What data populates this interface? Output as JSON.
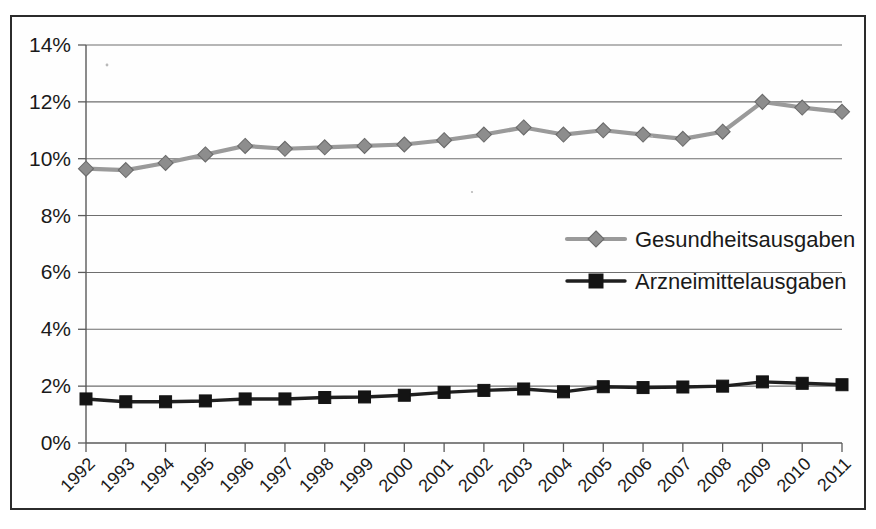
{
  "chart_data": {
    "type": "line",
    "title": "",
    "subtitle": "",
    "xlabel": "",
    "ylabel": "",
    "grid": true,
    "legend_position": "inside-center-right",
    "categories": [
      "1992",
      "1993",
      "1994",
      "1995",
      "1996",
      "1997",
      "1998",
      "1999",
      "2000",
      "2001",
      "2002",
      "2003",
      "2004",
      "2005",
      "2006",
      "2007",
      "2008",
      "2009",
      "2010",
      "2011"
    ],
    "ylim": [
      0,
      14
    ],
    "ytick_labels": [
      "0%",
      "2%",
      "4%",
      "6%",
      "8%",
      "10%",
      "12%",
      "14%"
    ],
    "ytick_values": [
      0,
      2,
      4,
      6,
      8,
      10,
      12,
      14
    ],
    "y_unit": "%",
    "series": [
      {
        "name": "Gesundheitsausgaben",
        "color": "#8d8d8d",
        "marker": "diamond",
        "values": [
          9.65,
          9.6,
          9.85,
          10.15,
          10.45,
          10.35,
          10.4,
          10.45,
          10.5,
          10.65,
          10.85,
          11.1,
          10.85,
          11.0,
          10.85,
          10.7,
          10.95,
          12.0,
          11.8,
          11.65
        ]
      },
      {
        "name": "Arzneimittelausgaben",
        "color": "#141414",
        "marker": "square",
        "values": [
          1.55,
          1.45,
          1.45,
          1.48,
          1.55,
          1.55,
          1.6,
          1.62,
          1.68,
          1.78,
          1.85,
          1.9,
          1.8,
          1.98,
          1.95,
          1.97,
          2.0,
          2.15,
          2.1,
          2.05
        ]
      }
    ]
  },
  "legend": {
    "items": [
      {
        "label": "Gesundheitsausgaben",
        "marker": "diamond-marker-icon",
        "color": "#8d8d8d"
      },
      {
        "label": "Arzneimittelausgaben",
        "marker": "square-marker-icon",
        "color": "#141414"
      }
    ]
  },
  "frame": {
    "border_color": "#2b2b2b",
    "background": "#fefefe"
  }
}
